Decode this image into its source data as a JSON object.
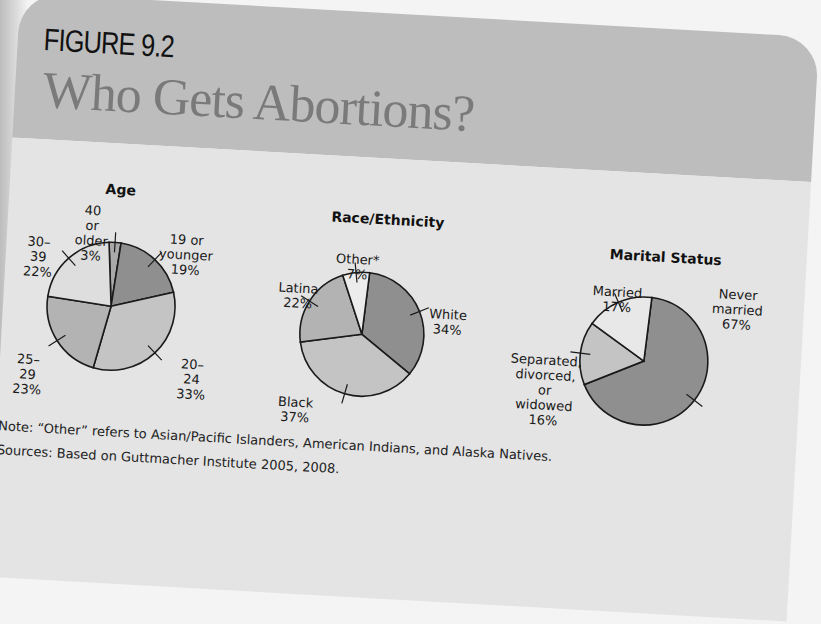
{
  "figure": {
    "label": "FIGURE 9.2",
    "title": "Who Gets Abortions?"
  },
  "colors": {
    "header_band": "#bdbdbd",
    "panel": "#e4e4e4",
    "outline": "#1a1a1a",
    "shade_darkest": "#8f8f8f",
    "shade_dark": "#a6a6a6",
    "shade_mid": "#bcbcbc",
    "shade_light": "#cfcfcf",
    "shade_lightest": "#ececec"
  },
  "chart_data": [
    {
      "type": "pie",
      "title": "Age",
      "categories": [
        "40 or older",
        "19 or younger",
        "20–24",
        "25–29",
        "30–39"
      ],
      "values": [
        3,
        19,
        33,
        23,
        22
      ],
      "unit": "%",
      "labels": [
        "40 or older\n3%",
        "19 or younger\n19%",
        "20–24\n33%",
        "25–29\n23%",
        "30–39\n22%"
      ],
      "fills": [
        "#a9a9a9",
        "#8f8f8f",
        "#c4c4c4",
        "#b3b3b3",
        "#dedede"
      ],
      "start_angle_deg": -5
    },
    {
      "type": "pie",
      "title": "Race/Ethnicity",
      "categories": [
        "White",
        "Black",
        "Latina",
        "Other*"
      ],
      "values": [
        34,
        37,
        22,
        7
      ],
      "unit": "%",
      "labels": [
        "White\n34%",
        "Black\n37%",
        "Latina\n22%",
        "Other*\n7%"
      ],
      "fills": [
        "#8f8f8f",
        "#c4c4c4",
        "#b3b3b3",
        "#ececec"
      ],
      "start_angle_deg": 4
    },
    {
      "type": "pie",
      "title": "Marital Status",
      "categories": [
        "Never married",
        "Separated, divorced, or widowed",
        "Married"
      ],
      "values": [
        67,
        16,
        17
      ],
      "unit": "%",
      "labels": [
        "Never\nmarried\n67%",
        "Separated,\ndivorced, or\nwidowed\n16%",
        "Married\n17%"
      ],
      "fills": [
        "#8f8f8f",
        "#c4c4c4",
        "#e8e8e8"
      ],
      "start_angle_deg": 4
    }
  ],
  "notes": {
    "note": "Note: “Other” refers to Asian/Pacific Islanders, American Indians, and Alaska Natives.",
    "sources": "Sources: Based on Guttmacher Institute 2005, 2008."
  }
}
